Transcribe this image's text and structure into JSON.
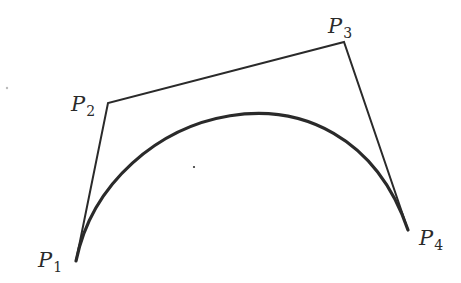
{
  "diagram": {
    "type": "cubic-bezier-curve",
    "stroke_color": "#2a2a2a",
    "control_points": [
      {
        "name": "P",
        "index": "1",
        "x": 76,
        "y": 261
      },
      {
        "name": "P",
        "index": "2",
        "x": 108,
        "y": 103
      },
      {
        "name": "P",
        "index": "3",
        "x": 344,
        "y": 42
      },
      {
        "name": "P",
        "index": "4",
        "x": 408,
        "y": 230
      }
    ],
    "labels": {
      "p1": {
        "letter": "P",
        "sub": "1"
      },
      "p2": {
        "letter": "P",
        "sub": "2"
      },
      "p3": {
        "letter": "P",
        "sub": "3"
      },
      "p4": {
        "letter": "P",
        "sub": "4"
      }
    }
  }
}
